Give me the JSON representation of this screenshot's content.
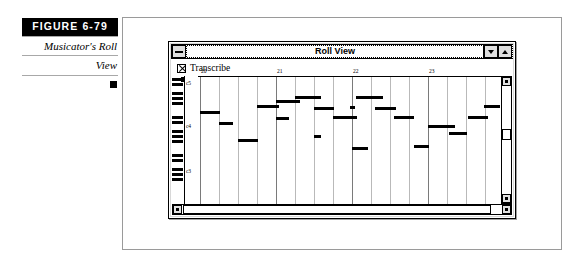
{
  "caption": {
    "figure_tag": "FIGURE  6-79",
    "line1": "Musicator's Roll",
    "line2": "View"
  },
  "window": {
    "title": "Roll View",
    "sysmenu_icon": "minimize-box-icon",
    "minimize_icon": "triangle-down-icon",
    "maximize_icon": "triangle-up-icon"
  },
  "toolbar": {
    "transcribe_label": "Transcribe",
    "transcribe_checked": true,
    "checkbox_icon": "x-checkbox-icon"
  },
  "keyboard": {
    "octave_labels": [
      {
        "text": "c5",
        "y": 4
      },
      {
        "text": "c4",
        "y": 47
      },
      {
        "text": "c3",
        "y": 92
      }
    ]
  },
  "scrollbars": {
    "v_up_icon": "arrow-up-icon",
    "v_down_icon": "arrow-down-icon",
    "h_left_icon": "arrow-left-icon",
    "h_right_icon": "arrow-right-icon"
  },
  "chart_data": {
    "type": "scatter",
    "title": "Roll View",
    "xlabel": "",
    "ylabel": "",
    "grid": true,
    "legend": "none",
    "x_tick_labels": [
      "20",
      "21",
      "22",
      "23"
    ],
    "x_tick_positions": [
      2,
      78,
      154,
      230
    ],
    "xlim": [
      0,
      306
    ],
    "ylim": [
      0,
      115
    ],
    "beat_line_spacing": 19,
    "measure_line_count": 17,
    "note_color": "#000000",
    "notes": [
      {
        "x": 2,
        "y": 34,
        "w": 20
      },
      {
        "x": 21,
        "y": 45,
        "w": 14
      },
      {
        "x": 40,
        "y": 62,
        "w": 20
      },
      {
        "x": 59,
        "y": 28,
        "w": 22
      },
      {
        "x": 78,
        "y": 40,
        "w": 13
      },
      {
        "x": 78,
        "y": 23,
        "w": 24
      },
      {
        "x": 97,
        "y": 19,
        "w": 26
      },
      {
        "x": 116,
        "y": 30,
        "w": 20
      },
      {
        "x": 116,
        "y": 58,
        "w": 7
      },
      {
        "x": 135,
        "y": 39,
        "w": 24
      },
      {
        "x": 154,
        "y": 70,
        "w": 16
      },
      {
        "x": 152,
        "y": 29,
        "w": 5
      },
      {
        "x": 158,
        "y": 19,
        "w": 27
      },
      {
        "x": 177,
        "y": 30,
        "w": 21
      },
      {
        "x": 196,
        "y": 39,
        "w": 20
      },
      {
        "x": 216,
        "y": 68,
        "w": 15
      },
      {
        "x": 230,
        "y": 48,
        "w": 27
      },
      {
        "x": 251,
        "y": 55,
        "w": 18
      },
      {
        "x": 270,
        "y": 39,
        "w": 20
      },
      {
        "x": 286,
        "y": 28,
        "w": 16
      }
    ]
  }
}
